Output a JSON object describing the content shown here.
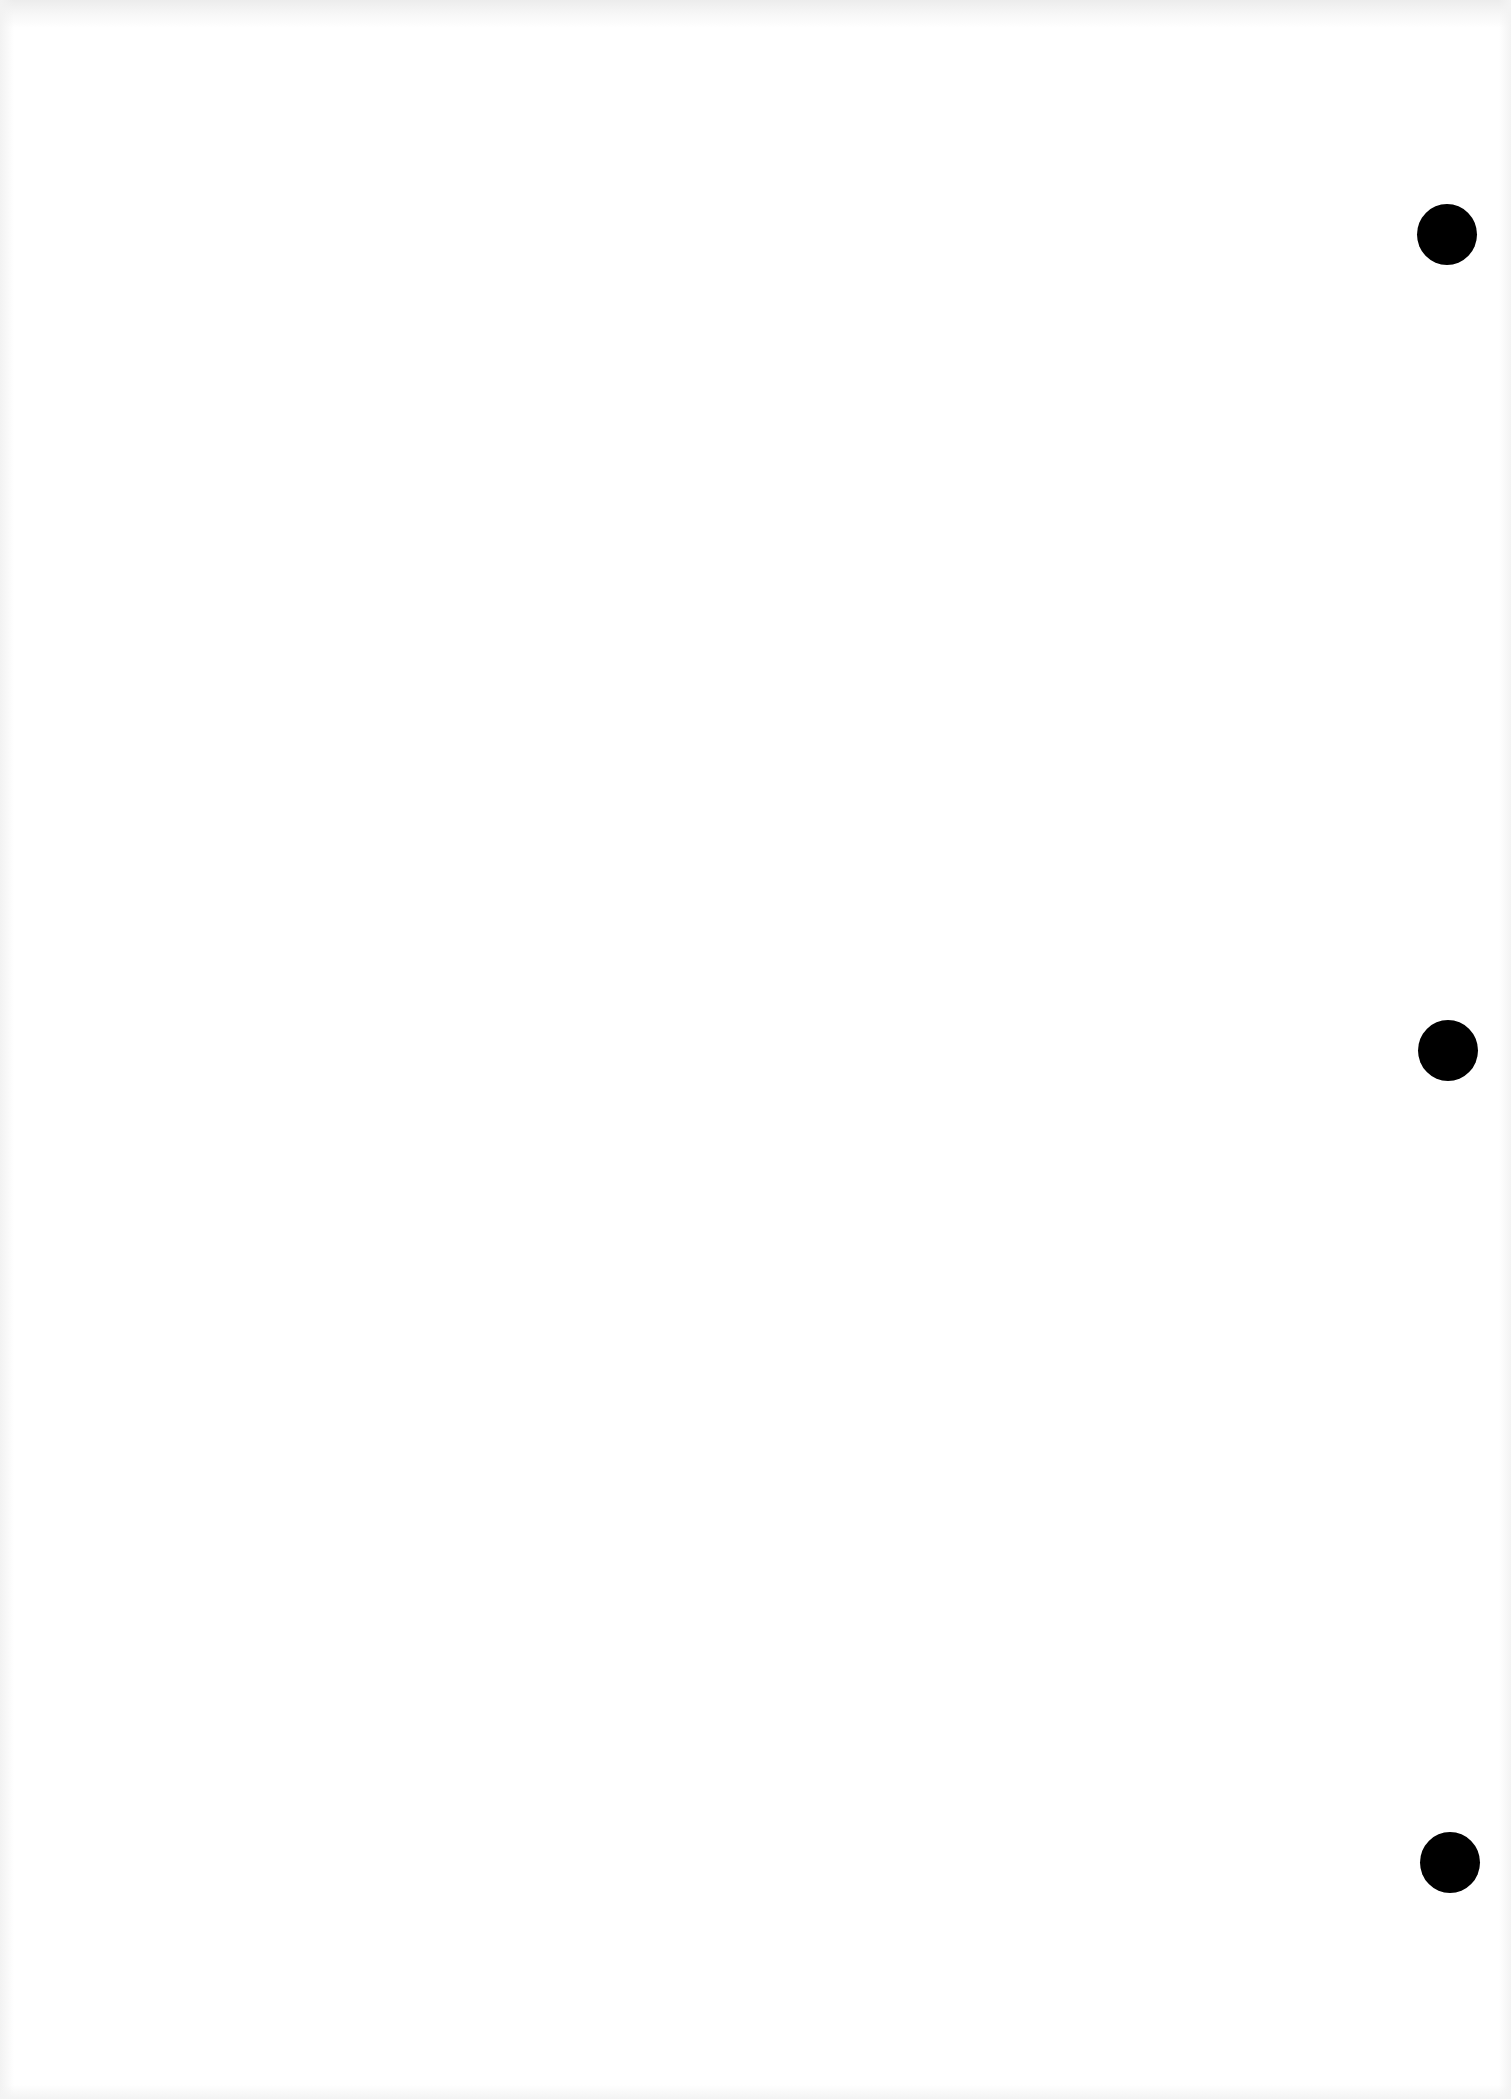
{
  "document": {
    "type": "blank scanned page",
    "text_content": "",
    "background_color": "#ffffff",
    "punch_holes": [
      {
        "cx": 1447,
        "cy": 234,
        "diameter": 60,
        "color": "#000000"
      },
      {
        "cx": 1448,
        "cy": 1050,
        "diameter": 60,
        "color": "#000000"
      },
      {
        "cx": 1450,
        "cy": 1862,
        "diameter": 60,
        "color": "#000000"
      }
    ]
  }
}
